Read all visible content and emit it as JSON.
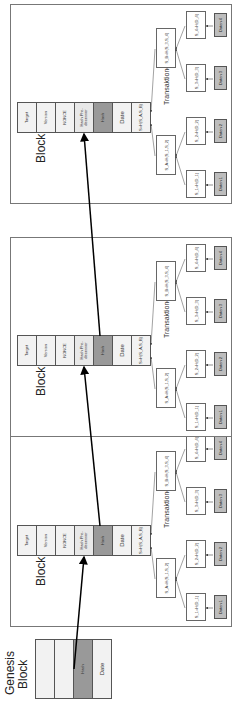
{
  "genesis": {
    "title_line1": "Genesis",
    "title_line2": "Block",
    "cells": [
      "",
      "",
      "Hash",
      "Date"
    ]
  },
  "blocks": [
    {
      "title": "Block 1",
      "transactions": "Transaktionen 1"
    },
    {
      "title": "Block 2",
      "transactions": "Transaktionen 2"
    },
    {
      "title": "Block 3",
      "transactions": "Transaktionen 3"
    }
  ],
  "header_cells": [
    "Target",
    "Version",
    "NONCE",
    "Hash Pre-decessor",
    "Hash",
    "Date",
    "S=H(S_A,S_B)"
  ],
  "tree": {
    "mid_left": "S_A=H(S_1,S_2)",
    "mid_right": "S_B=H(S_3,S_4)",
    "hashes": [
      "S_1=H(D_1)",
      "S_2=H(D_2)",
      "S_3=H(D_3)",
      "S_4=H(D_4)"
    ],
    "data": [
      "Daten 1",
      "Daten 2",
      "Daten 3",
      "Daten 4"
    ]
  },
  "colors": {
    "hash_cell": "#999999",
    "data_leaf": "#bdbdbd",
    "predecessor_cell": "#e8e8e8"
  }
}
